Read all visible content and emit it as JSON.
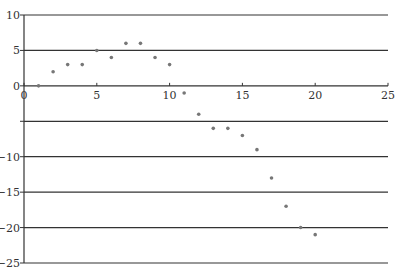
{
  "chart_data": {
    "type": "scatter",
    "title": "",
    "xlabel": "",
    "ylabel": "",
    "xlim": [
      0,
      25
    ],
    "ylim": [
      -25,
      10
    ],
    "x_ticks": [
      0,
      5,
      10,
      15,
      20,
      25
    ],
    "x_tick_labels": [
      "0",
      "5",
      "10",
      "15",
      "20",
      "25"
    ],
    "y_ticks": [
      10,
      5,
      0,
      -5,
      -10,
      -15,
      -20,
      -25
    ],
    "y_tick_labels": [
      "10",
      "5",
      "0",
      "",
      "-10",
      "-15",
      "-20",
      "-25"
    ],
    "grid": "horizontal",
    "legend": null,
    "series": [
      {
        "name": "data",
        "x": [
          1,
          2,
          3,
          4,
          5,
          6,
          7,
          8,
          9,
          10,
          11,
          12,
          13,
          14,
          15,
          16,
          17,
          18,
          19,
          20
        ],
        "y": [
          0,
          2,
          3,
          3,
          5,
          4,
          6,
          6,
          4,
          3,
          -1,
          -4,
          -6,
          -6,
          -7,
          -9,
          -13,
          -17,
          -20,
          -21
        ]
      }
    ],
    "colors": {
      "axis": "#333333",
      "grid": "#333333",
      "marker": "#777777"
    }
  }
}
